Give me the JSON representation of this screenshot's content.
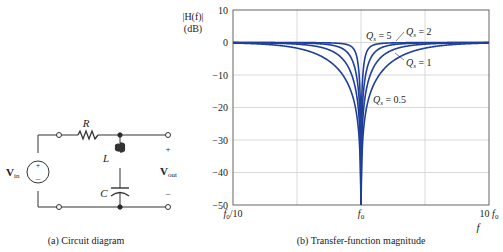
{
  "circuit": {
    "caption": "(a) Circuit diagram",
    "labels": {
      "resistor": "R",
      "inductor": "L",
      "capacitor": "C",
      "vin_main": "V",
      "vin_sub": "in",
      "vout_main": "V",
      "vout_sub": "out",
      "plus": "+",
      "minus": "–",
      "source_plus": "+",
      "source_minus": "–"
    }
  },
  "plot": {
    "caption": "(b) Transfer-function magnitude",
    "ylabel_line1": "|H(f)|",
    "ylabel_line2": "(dB)",
    "xlabel": "f",
    "line_color": "#1f3f9a",
    "grid_color": "#cccccc"
  },
  "chart_data": {
    "type": "line",
    "title": "(b) Transfer-function magnitude",
    "xlabel": "f",
    "ylabel": "|H(f)| (dB)",
    "xscale": "log",
    "xlim": [
      "f0/10",
      "10 f0"
    ],
    "x_ticks": [
      "f0/10",
      "f0",
      "10 f0"
    ],
    "ylim": [
      -50,
      10
    ],
    "y_ticks": [
      10,
      0,
      -10,
      -20,
      -30,
      -40,
      -50
    ],
    "grid": true,
    "series": [
      {
        "name": "Qs = 0.5",
        "Q": 0.5
      },
      {
        "name": "Qs = 1",
        "Q": 1
      },
      {
        "name": "Qs = 2",
        "Q": 2
      },
      {
        "name": "Qs = 5",
        "Q": 5
      }
    ],
    "annotations": [
      "Qs = 5",
      "Qs = 2",
      "Qs = 1",
      "Qs = 0.5"
    ],
    "formula": "H = (1 - x^2) / (1 - x^2 + j x / Q), x = f/f0"
  },
  "ticks": {
    "y": [
      "10",
      "0",
      "−10",
      "−20",
      "−30",
      "−40",
      "−50"
    ],
    "x_left": "f",
    "x_left_sub": "0",
    "x_left_suffix": "/10",
    "x_mid": "f",
    "x_mid_sub": "0",
    "x_right_prefix": "10 ",
    "x_right": "f",
    "x_right_sub": "0"
  },
  "annotations": {
    "q5": {
      "q": "Q",
      "sub": "s",
      "val": " = 5"
    },
    "q2": {
      "q": "Q",
      "sub": "s",
      "val": " = 2"
    },
    "q1": {
      "q": "Q",
      "sub": "s",
      "val": " = 1"
    },
    "q05": {
      "q": "Q",
      "sub": "s",
      "val": " = 0.5"
    }
  }
}
